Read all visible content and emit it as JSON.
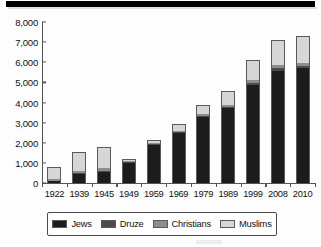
{
  "chart_data": {
    "type": "bar",
    "stacked": true,
    "title": "",
    "xlabel": "",
    "ylabel": "",
    "unit": "thousands",
    "grid": false,
    "legend_position": "bottom",
    "ylim": [
      0,
      8000
    ],
    "yticks": [
      "0",
      "1,000",
      "2,000",
      "3,000",
      "4,000",
      "5,000",
      "6,000",
      "7,000",
      "8,000"
    ],
    "ytick_values": [
      0,
      1000,
      2000,
      3000,
      4000,
      5000,
      6000,
      7000,
      8000
    ],
    "categories": [
      "1922",
      "1939",
      "1945",
      "1949",
      "1959",
      "1969",
      "1979",
      "1989",
      "1999",
      "2008",
      "2010"
    ],
    "series": [
      {
        "name": "Jews",
        "color": "#1c1c1c",
        "values": [
          84,
          449,
          554,
          1013,
          1911,
          2496,
          3283,
          3717,
          4872,
          5569,
          5703
        ]
      },
      {
        "name": "Druze",
        "color": "#4a4a4a",
        "values": [
          7,
          15,
          15,
          15,
          25,
          35,
          50,
          78,
          104,
          122,
          127
        ]
      },
      {
        "name": "Christians",
        "color": "#8d8d8d",
        "values": [
          71,
          116,
          136,
          34,
          48,
          73,
          89,
          107,
          130,
          151,
          154
        ]
      },
      {
        "name": "Muslims",
        "color": "#d6d6d6",
        "values": [
          589,
          927,
          1061,
          111,
          139,
          314,
          462,
          677,
          995,
          1241,
          1320
        ]
      }
    ],
    "totals": [
      751,
      1507,
      1766,
      1173,
      2123,
      2918,
      3884,
      4579,
      6101,
      7083,
      7304
    ]
  },
  "legend": {
    "items": [
      {
        "label": "Jews",
        "swatch": "jews"
      },
      {
        "label": "Druze",
        "swatch": "druze"
      },
      {
        "label": "Christians",
        "swatch": "christians"
      },
      {
        "label": "Muslims",
        "swatch": "muslims"
      }
    ]
  }
}
